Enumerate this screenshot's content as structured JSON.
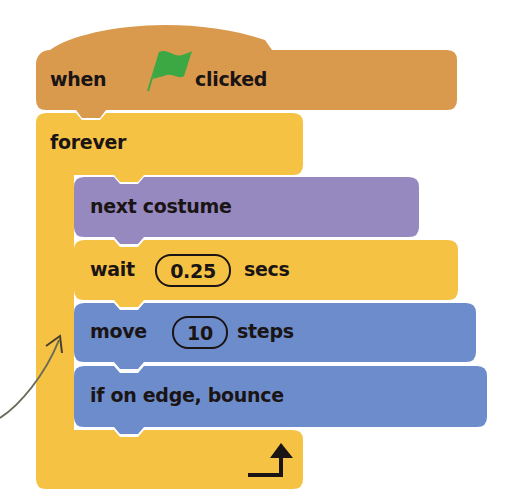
{
  "colors": {
    "events": "#D99A4E",
    "control": "#F6C244",
    "looks": "#9589BF",
    "motion": "#6D8CCB",
    "flag": "#3BA843",
    "text": "#1a1414",
    "annotation_arrow": "#6b6b5a"
  },
  "script": {
    "hat_block": {
      "category": "events",
      "label_before": "when",
      "icon": "green-flag-icon",
      "label_after": "clicked"
    },
    "forever_block": {
      "category": "control",
      "label": "forever",
      "end_icon": "loop-arrow-icon",
      "children": [
        {
          "category": "looks",
          "label": "next costume"
        },
        {
          "category": "control",
          "label_before": "wait",
          "input": "0.25",
          "label_after": "secs"
        },
        {
          "category": "motion",
          "label_before": "move",
          "input": "10",
          "label_after": "steps"
        },
        {
          "category": "motion",
          "label": "if on edge, bounce"
        }
      ]
    }
  },
  "annotation": {
    "icon": "curved-pointer-arrow-icon"
  }
}
